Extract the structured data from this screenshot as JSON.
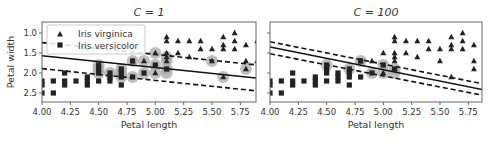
{
  "chart_data": [
    {
      "type": "scatter",
      "title": "C = 1",
      "xlabel": "Petal length",
      "ylabel": "Petal width",
      "xlim": [
        4.0,
        5.9
      ],
      "ylim": [
        0.8,
        2.8
      ],
      "xticks": [
        "4.00",
        "4.25",
        "4.50",
        "4.75",
        "5.00",
        "5.25",
        "5.50",
        "5.75"
      ],
      "yticks": [
        "1.0",
        "1.5",
        "2.0",
        "2.5"
      ],
      "grid": false,
      "legend": {
        "position": "upper left",
        "entries": [
          "Iris virginica",
          "Iris versicolor"
        ]
      },
      "decision_boundary": {
        "x": [
          4.0,
          5.9
        ],
        "y": [
          1.93,
          1.37
        ]
      },
      "margin_upper": {
        "x": [
          4.0,
          5.9
        ],
        "y": [
          2.26,
          1.7
        ]
      },
      "margin_lower": {
        "x": [
          4.0,
          5.9
        ],
        "y": [
          1.61,
          1.05
        ]
      },
      "series": [
        {
          "name": "Iris virginica",
          "marker": "triangle",
          "points": [
            [
              4.8,
              1.8
            ],
            [
              4.9,
              1.8
            ],
            [
              5.0,
              1.5
            ],
            [
              5.0,
              2.0
            ],
            [
              5.1,
              1.8
            ],
            [
              5.1,
              1.9
            ],
            [
              5.1,
              2.3
            ],
            [
              5.1,
              2.4
            ],
            [
              5.1,
              2.0
            ],
            [
              5.2,
              2.0
            ],
            [
              5.2,
              2.3
            ],
            [
              5.3,
              1.9
            ],
            [
              5.3,
              2.3
            ],
            [
              5.4,
              2.1
            ],
            [
              5.4,
              2.3
            ],
            [
              5.5,
              1.8
            ],
            [
              5.5,
              2.1
            ],
            [
              5.6,
              1.4
            ],
            [
              5.6,
              2.1
            ],
            [
              5.6,
              2.2
            ],
            [
              5.6,
              2.4
            ],
            [
              5.7,
              2.1
            ],
            [
              5.7,
              2.3
            ],
            [
              5.7,
              2.5
            ],
            [
              5.8,
              1.6
            ],
            [
              5.8,
              1.8
            ],
            [
              5.8,
              2.2
            ],
            [
              5.9,
              1.8
            ],
            [
              5.9,
              2.3
            ]
          ]
        },
        {
          "name": "Iris versicolor",
          "marker": "square",
          "points": [
            [
              4.0,
              1.0
            ],
            [
              4.0,
              1.2
            ],
            [
              4.0,
              1.3
            ],
            [
              4.1,
              1.0
            ],
            [
              4.1,
              1.3
            ],
            [
              4.2,
              1.2
            ],
            [
              4.2,
              1.3
            ],
            [
              4.2,
              1.5
            ],
            [
              4.3,
              1.3
            ],
            [
              4.4,
              1.2
            ],
            [
              4.4,
              1.3
            ],
            [
              4.4,
              1.4
            ],
            [
              4.5,
              1.3
            ],
            [
              4.5,
              1.5
            ],
            [
              4.5,
              1.6
            ],
            [
              4.5,
              1.7
            ],
            [
              4.6,
              1.3
            ],
            [
              4.6,
              1.4
            ],
            [
              4.6,
              1.5
            ],
            [
              4.7,
              1.2
            ],
            [
              4.7,
              1.4
            ],
            [
              4.7,
              1.5
            ],
            [
              4.7,
              1.6
            ],
            [
              4.8,
              1.4
            ],
            [
              4.8,
              1.8
            ],
            [
              4.9,
              1.5
            ],
            [
              5.0,
              1.7
            ],
            [
              5.1,
              1.6
            ]
          ]
        }
      ],
      "support_vectors": [
        [
          4.5,
          1.5
        ],
        [
          4.5,
          1.6
        ],
        [
          4.5,
          1.7
        ],
        [
          4.6,
          1.5
        ],
        [
          4.7,
          1.4
        ],
        [
          4.7,
          1.5
        ],
        [
          4.7,
          1.6
        ],
        [
          4.8,
          1.4
        ],
        [
          4.8,
          1.8
        ],
        [
          4.9,
          1.5
        ],
        [
          4.9,
          1.8
        ],
        [
          5.0,
          1.5
        ],
        [
          5.0,
          1.7
        ],
        [
          5.0,
          2.0
        ],
        [
          5.1,
          1.5
        ],
        [
          5.1,
          1.6
        ],
        [
          5.1,
          1.8
        ],
        [
          5.1,
          1.9
        ],
        [
          5.5,
          1.8
        ],
        [
          5.6,
          1.4
        ],
        [
          5.8,
          1.6
        ]
      ]
    },
    {
      "type": "scatter",
      "title": "C = 100",
      "xlabel": "Petal length",
      "ylabel": "",
      "xlim": [
        4.0,
        5.9
      ],
      "ylim": [
        0.8,
        2.8
      ],
      "xticks": [
        "4.00",
        "4.25",
        "4.50",
        "4.75",
        "5.00",
        "5.25",
        "5.50",
        "5.75"
      ],
      "yticks": [
        "",
        "",
        "",
        ""
      ],
      "grid": false,
      "decision_boundary": {
        "x": [
          4.0,
          5.9
        ],
        "y": [
          2.15,
          1.07
        ]
      },
      "margin_upper": {
        "x": [
          4.0,
          5.9
        ],
        "y": [
          2.28,
          1.22
        ]
      },
      "margin_lower": {
        "x": [
          4.0,
          5.9
        ],
        "y": [
          1.98,
          0.93
        ]
      },
      "series": [
        {
          "name": "Iris virginica",
          "marker": "triangle",
          "points": [
            [
              4.8,
              1.8
            ],
            [
              4.9,
              1.8
            ],
            [
              5.0,
              1.5
            ],
            [
              5.0,
              2.0
            ],
            [
              5.1,
              1.8
            ],
            [
              5.1,
              1.9
            ],
            [
              5.1,
              2.3
            ],
            [
              5.1,
              2.4
            ],
            [
              5.1,
              2.0
            ],
            [
              5.2,
              2.0
            ],
            [
              5.2,
              2.3
            ],
            [
              5.3,
              1.9
            ],
            [
              5.3,
              2.3
            ],
            [
              5.4,
              2.1
            ],
            [
              5.4,
              2.3
            ],
            [
              5.5,
              1.8
            ],
            [
              5.5,
              2.1
            ],
            [
              5.6,
              1.4
            ],
            [
              5.6,
              2.1
            ],
            [
              5.6,
              2.2
            ],
            [
              5.6,
              2.4
            ],
            [
              5.7,
              2.1
            ],
            [
              5.7,
              2.3
            ],
            [
              5.7,
              2.5
            ],
            [
              5.8,
              1.6
            ],
            [
              5.8,
              1.8
            ],
            [
              5.8,
              2.2
            ],
            [
              5.9,
              1.8
            ],
            [
              5.9,
              2.3
            ]
          ]
        },
        {
          "name": "Iris versicolor",
          "marker": "square",
          "points": [
            [
              4.0,
              1.0
            ],
            [
              4.0,
              1.2
            ],
            [
              4.0,
              1.3
            ],
            [
              4.1,
              1.0
            ],
            [
              4.1,
              1.3
            ],
            [
              4.2,
              1.2
            ],
            [
              4.2,
              1.3
            ],
            [
              4.2,
              1.5
            ],
            [
              4.3,
              1.3
            ],
            [
              4.4,
              1.2
            ],
            [
              4.4,
              1.3
            ],
            [
              4.4,
              1.4
            ],
            [
              4.5,
              1.3
            ],
            [
              4.5,
              1.5
            ],
            [
              4.5,
              1.6
            ],
            [
              4.5,
              1.7
            ],
            [
              4.6,
              1.3
            ],
            [
              4.6,
              1.4
            ],
            [
              4.6,
              1.5
            ],
            [
              4.7,
              1.2
            ],
            [
              4.7,
              1.4
            ],
            [
              4.7,
              1.5
            ],
            [
              4.7,
              1.6
            ],
            [
              4.8,
              1.4
            ],
            [
              4.8,
              1.8
            ],
            [
              4.9,
              1.5
            ],
            [
              5.0,
              1.7
            ],
            [
              5.1,
              1.6
            ]
          ]
        }
      ],
      "support_vectors": [
        [
          4.5,
          1.7
        ],
        [
          4.7,
          1.6
        ],
        [
          4.8,
          1.8
        ],
        [
          4.9,
          1.5
        ],
        [
          5.0,
          1.7
        ],
        [
          5.0,
          1.5
        ],
        [
          5.1,
          1.6
        ],
        [
          5.1,
          1.5
        ]
      ]
    }
  ],
  "colors": {
    "markers": "#222222",
    "support_vector_halo": "#aaaaaa",
    "axes": "#666666",
    "text": "#333333",
    "legend_border": "#cccccc"
  }
}
